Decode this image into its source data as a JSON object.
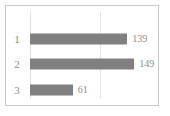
{
  "chart_data": {
    "type": "bar",
    "orientation": "horizontal",
    "title": "",
    "xlabel": "",
    "ylabel": "",
    "categories": [
      "1",
      "2",
      "3"
    ],
    "values": [
      139,
      149,
      61
    ],
    "value_labels": [
      "139",
      "149",
      "61"
    ],
    "xlim": [
      0,
      180
    ],
    "gridlines_x": [
      0,
      100
    ],
    "grid": true,
    "legend": null,
    "series": [
      {
        "name": "",
        "values": [
          139,
          149,
          61
        ]
      }
    ]
  },
  "style": {
    "bar_color": "#808080",
    "text_color": "#8c8c8c",
    "gridline_color": "#e3e3e3",
    "border_color": "#c9c9c9",
    "background": "#ffffff"
  }
}
